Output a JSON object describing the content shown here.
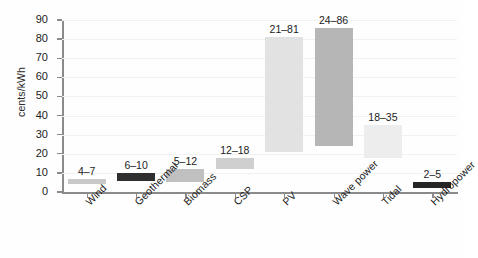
{
  "chart_data": {
    "type": "bar",
    "bar_style": "floating-range",
    "title": "",
    "subtitle": "",
    "xlabel": "",
    "ylabel": "cents/kWh",
    "ylim": [
      0,
      90
    ],
    "ytick_step": 10,
    "yticks": [
      0,
      10,
      20,
      30,
      40,
      50,
      60,
      70,
      80,
      90
    ],
    "ytick_labels": [
      "0",
      "10",
      "20",
      "30",
      "40",
      "50",
      "60",
      "70",
      "80",
      "90"
    ],
    "grid": "horizontal",
    "legend": "none",
    "categories": [
      "Wind",
      "Geothermal",
      "Biomass",
      "CSP",
      "PV",
      "Wave power",
      "Tidal",
      "Hydropower"
    ],
    "low": [
      4,
      6,
      5,
      12,
      21,
      24,
      18,
      2
    ],
    "high": [
      7,
      10,
      12,
      18,
      81,
      86,
      35,
      5
    ],
    "annotations": [
      "4–7",
      "6–10",
      "5–12",
      "12–18",
      "21–81",
      "24–86",
      "18–35",
      "2–5"
    ],
    "bar_colors": [
      "#c9c9c9",
      "#2f2f2f",
      "#c0c0c0",
      "#cfcfcf",
      "#e2e2e2",
      "#b6b6b6",
      "#ededed",
      "#262626"
    ],
    "bars": [
      {
        "category": "Wind",
        "low": 4,
        "high": 7,
        "label": "4–7",
        "color": "#c9c9c9"
      },
      {
        "category": "Geothermal",
        "low": 6,
        "high": 10,
        "label": "6–10",
        "color": "#2f2f2f"
      },
      {
        "category": "Biomass",
        "low": 5,
        "high": 12,
        "label": "5–12",
        "color": "#c0c0c0"
      },
      {
        "category": "CSP",
        "low": 12,
        "high": 18,
        "label": "12–18",
        "color": "#cfcfcf"
      },
      {
        "category": "PV",
        "low": 21,
        "high": 81,
        "label": "21–81",
        "color": "#e2e2e2"
      },
      {
        "category": "Wave power",
        "low": 24,
        "high": 86,
        "label": "24–86",
        "color": "#b6b6b6"
      },
      {
        "category": "Tidal",
        "low": 18,
        "high": 35,
        "label": "18–35",
        "color": "#ededed"
      },
      {
        "category": "Hydropower",
        "low": 2,
        "high": 5,
        "label": "2–5",
        "color": "#262626"
      }
    ],
    "axis_color": "#8b8b8b",
    "grid_color": "#f1f1f1",
    "text_color": "#1c1c1c",
    "background": "#fefefe"
  }
}
